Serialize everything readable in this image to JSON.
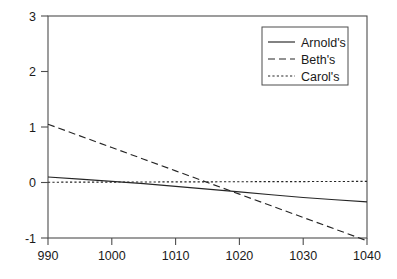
{
  "chart_data": {
    "type": "line",
    "title": "",
    "xlabel": "",
    "ylabel": "",
    "xlim": [
      990,
      1040
    ],
    "ylim": [
      -1.0,
      3.0
    ],
    "xticks": [
      990,
      1000,
      1010,
      1020,
      1030,
      1040
    ],
    "yticks": [
      -1,
      0,
      1,
      2,
      3
    ],
    "xtick_labels": [
      "990",
      "1000",
      "1010",
      "1020",
      "1030",
      "1040"
    ],
    "ytick_labels": [
      "-1",
      "0",
      "1",
      "2",
      "3"
    ],
    "grid": false,
    "legend_position": "top-right",
    "background_color": "#ffffff",
    "axis_color": "#4d4d4d",
    "series": [
      {
        "name": "Arnold's",
        "style": "solid",
        "color": "#262626",
        "x": [
          990,
          995,
          1000,
          1005,
          1010,
          1015,
          1020,
          1025,
          1030,
          1035,
          1040
        ],
        "values": [
          0.1,
          0.06,
          0.02,
          -0.02,
          -0.07,
          -0.12,
          -0.17,
          -0.22,
          -0.27,
          -0.31,
          -0.35
        ]
      },
      {
        "name": "Beth's",
        "style": "dashed",
        "color": "#262626",
        "x": [
          990,
          995,
          1000,
          1005,
          1010,
          1015,
          1020,
          1025,
          1030,
          1035,
          1040
        ],
        "values": [
          1.05,
          0.84,
          0.63,
          0.42,
          0.21,
          0.0,
          -0.21,
          -0.42,
          -0.63,
          -0.84,
          -1.05
        ]
      },
      {
        "name": "Carol's",
        "style": "dotted",
        "color": "#262626",
        "x": [
          990,
          995,
          1000,
          1005,
          1010,
          1015,
          1020,
          1025,
          1030,
          1035,
          1040
        ],
        "values": [
          0.005,
          0.006,
          0.008,
          0.009,
          0.011,
          0.012,
          0.014,
          0.015,
          0.017,
          0.018,
          0.02
        ]
      }
    ]
  },
  "legend": {
    "entries": [
      {
        "label": "Arnold's",
        "style": "solid"
      },
      {
        "label": "Beth's",
        "style": "dashed"
      },
      {
        "label": "Carol's",
        "style": "dotted"
      }
    ]
  }
}
